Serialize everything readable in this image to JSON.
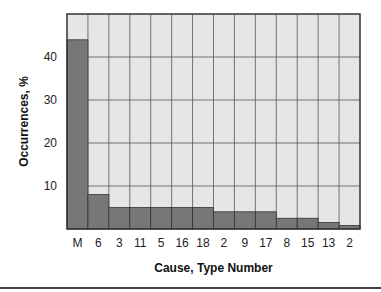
{
  "chart_data": {
    "type": "bar",
    "title": "",
    "xlabel": "Cause, Type Number",
    "ylabel": "Occurrences, %",
    "categories": [
      "M",
      "6",
      "3",
      "11",
      "5",
      "16",
      "18",
      "2",
      "9",
      "17",
      "8",
      "15",
      "13",
      "2"
    ],
    "values": [
      44,
      8,
      5,
      5,
      5,
      5,
      5,
      4,
      4,
      4,
      2.5,
      2.5,
      1.5,
      0.8
    ],
    "yticks": [
      10,
      20,
      30,
      40
    ],
    "ylim": [
      0,
      50
    ],
    "grid": true,
    "legend": null,
    "colors": {
      "bar": "#777777",
      "plot_bg": "#e6e6e6",
      "grid": "#555555"
    }
  }
}
